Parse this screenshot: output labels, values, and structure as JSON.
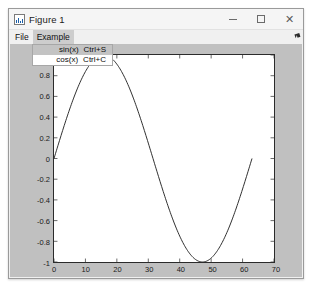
{
  "window": {
    "title": "Figure 1",
    "icon": "figure-icon",
    "controls": {
      "minimize": "—",
      "maximize": "□",
      "close": "✕"
    }
  },
  "menubar": {
    "items": [
      {
        "label": "File",
        "open": false
      },
      {
        "label": "Example",
        "open": true
      }
    ]
  },
  "dropdown": {
    "owner": "Example",
    "items": [
      {
        "label": "sin(x)",
        "accelerator": "Ctrl+S",
        "selected": true
      },
      {
        "label": "cos(x)",
        "accelerator": "Ctrl+C",
        "selected": false
      }
    ]
  },
  "colors": {
    "figure_background": "#c0c0c0",
    "axes_background": "#ffffff",
    "line": "#1a1a1a",
    "menu_highlight": "#c3c3c3",
    "window_chrome": "#f0f0f0"
  },
  "chart_data": {
    "type": "line",
    "title": "",
    "xlabel": "",
    "ylabel": "",
    "xlim": [
      0,
      70
    ],
    "ylim": [
      -1,
      1
    ],
    "xticks": [
      0,
      10,
      20,
      30,
      40,
      50,
      60,
      70
    ],
    "yticks": [
      1,
      0.8,
      0.6,
      0.4,
      0.2,
      0,
      -0.2,
      -0.4,
      -0.6,
      -0.8,
      -1
    ],
    "xtick_labels": [
      "0",
      "10",
      "20",
      "30",
      "40",
      "50",
      "60",
      "70"
    ],
    "ytick_labels": [
      "1",
      "0.8",
      "0.6",
      "0.4",
      "0.2",
      "0",
      "-0.2",
      "-0.4",
      "-0.6",
      "-0.8",
      "-1"
    ],
    "grid": false,
    "legend": null,
    "series": [
      {
        "name": "sin(x)",
        "color": "#1a1a1a",
        "formula": "sin(2*pi*x/63)",
        "x_start": 0,
        "x_end": 63,
        "x_step": 0.25,
        "amplitude": 1,
        "period": 63,
        "phase": 0,
        "annotations": [
          {
            "x": 0,
            "y": 0,
            "note": "start at zero, rising"
          },
          {
            "x": 15.8,
            "y": 1,
            "note": "maximum"
          },
          {
            "x": 31.5,
            "y": 0,
            "note": "zero crossing, falling"
          },
          {
            "x": 47.3,
            "y": -1,
            "note": "minimum"
          },
          {
            "x": 63,
            "y": -0.12,
            "note": "end of data, rising"
          }
        ]
      }
    ]
  }
}
